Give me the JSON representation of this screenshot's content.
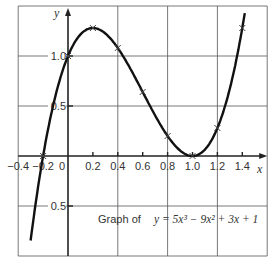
{
  "chart_data": {
    "type": "line",
    "title": "",
    "annotation": {
      "prefix": "Graph of",
      "equation": "y = 5x³ − 9x² + 3x + 1"
    },
    "xlabel": "x",
    "ylabel": "y",
    "xlim": [
      -0.4,
      1.6
    ],
    "ylim": [
      -1.0,
      1.5
    ],
    "grid": true,
    "x_ticks": [
      {
        "value": -0.4,
        "label": "−0.4"
      },
      {
        "value": -0.2,
        "label": "−0.2"
      },
      {
        "value": 0,
        "label": "0"
      },
      {
        "value": 0.2,
        "label": "0.2"
      },
      {
        "value": 0.4,
        "label": "0.4"
      },
      {
        "value": 0.6,
        "label": "0.6"
      },
      {
        "value": 0.8,
        "label": "0.8"
      },
      {
        "value": 1.0,
        "label": "1.0"
      },
      {
        "value": 1.2,
        "label": "1.2"
      },
      {
        "value": 1.4,
        "label": "1.4"
      }
    ],
    "y_ticks": [
      {
        "value": 1.0,
        "label": "1.0"
      },
      {
        "value": 0.5,
        "label": "0.5"
      },
      {
        "value": -0.5,
        "label": "0.5"
      }
    ],
    "function": {
      "coefficients": [
        5,
        -9,
        3,
        1
      ],
      "x_range": [
        -0.3,
        1.42
      ]
    },
    "series": [
      {
        "name": "y = 5x³ − 9x² + 3x + 1",
        "x": [
          -0.2,
          0,
          0.2,
          0.4,
          0.6,
          0.8,
          1.0,
          1.2,
          1.4
        ],
        "values": [
          0.0,
          1.0,
          1.28,
          1.08,
          0.64,
          0.2,
          0.0,
          0.28,
          1.28
        ]
      }
    ],
    "colors": {
      "curve": "#111111",
      "grid": "#555555",
      "axis": "#222222"
    }
  }
}
